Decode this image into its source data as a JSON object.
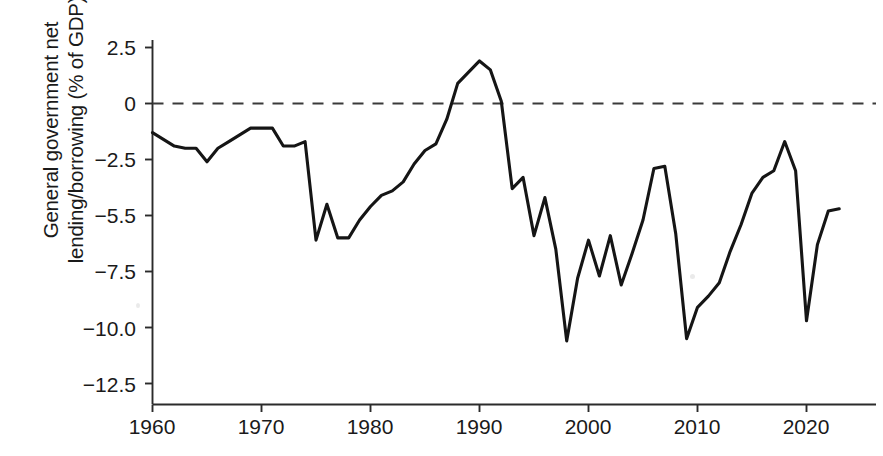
{
  "chart_data": {
    "type": "line",
    "title": "",
    "subtitle": "",
    "xlabel": "",
    "ylabel": "General government net\nlending/borrowing (% of GDP)",
    "xlim": [
      1960,
      2023
    ],
    "ylim": [
      -12.5,
      2.5
    ],
    "grid": false,
    "legend": null,
    "annotations": [
      {
        "name": "zero-reference-line",
        "type": "hline",
        "y": 0,
        "style": "dashed"
      }
    ],
    "x_tick_labels": [
      "1960",
      "1970",
      "1980",
      "1990",
      "2000",
      "2010",
      "2020"
    ],
    "x_ticks": [
      1960,
      1970,
      1980,
      1990,
      2000,
      2010,
      2020
    ],
    "y_tick_labels": [
      "2.5",
      "0",
      "−2.5",
      "−5.5",
      "−7.5",
      "−10.0",
      "−12.5"
    ],
    "y_ticks": [
      2.5,
      0,
      -2.5,
      -5.0,
      -7.5,
      -10.0,
      -12.5
    ],
    "series": [
      {
        "name": "General government net lending/borrowing",
        "color": "#151515",
        "x": [
          1960,
          1961,
          1962,
          1963,
          1964,
          1965,
          1966,
          1967,
          1968,
          1969,
          1970,
          1971,
          1972,
          1973,
          1974,
          1975,
          1976,
          1977,
          1978,
          1979,
          1980,
          1981,
          1982,
          1983,
          1984,
          1985,
          1986,
          1987,
          1988,
          1989,
          1990,
          1991,
          1992,
          1993,
          1994,
          1995,
          1996,
          1997,
          1998,
          1999,
          2000,
          2001,
          2002,
          2003,
          2004,
          2005,
          2006,
          2007,
          2008,
          2009,
          2010,
          2011,
          2012,
          2013,
          2014,
          2015,
          2016,
          2017,
          2018,
          2019,
          2020,
          2021,
          2022,
          2023
        ],
        "y": [
          -1.3,
          -1.6,
          -1.9,
          -2.0,
          -2.0,
          -2.6,
          -2.0,
          -1.7,
          -1.4,
          -1.1,
          -1.1,
          -1.1,
          -1.9,
          -1.9,
          -1.7,
          -6.1,
          -4.5,
          -6.0,
          -6.0,
          -5.2,
          -4.6,
          -4.1,
          -3.9,
          -3.5,
          -2.7,
          -2.1,
          -1.8,
          -0.7,
          0.9,
          1.4,
          1.9,
          1.5,
          0.1,
          -3.8,
          -3.3,
          -5.9,
          -4.2,
          -6.5,
          -10.6,
          -7.8,
          -6.1,
          -7.7,
          -5.9,
          -8.1,
          -6.7,
          -5.2,
          -2.9,
          -2.8,
          -5.8,
          -10.5,
          -9.1,
          -8.6,
          -8.0,
          -6.6,
          -5.4,
          -4.0,
          -3.3,
          -3.0,
          -1.7,
          -3.0,
          -9.7,
          -6.3,
          -4.8,
          -4.7
        ],
        "marker": "none",
        "linestyle": "solid"
      }
    ]
  },
  "axis": {
    "ylabel_line1": "General government net",
    "ylabel_line2": "lending/borrowing (% of GDP)"
  }
}
